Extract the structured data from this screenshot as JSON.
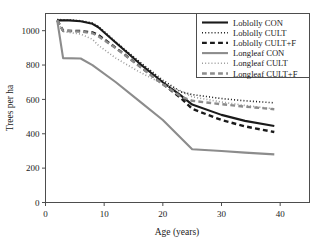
{
  "chart_data": {
    "type": "line",
    "title": "",
    "xlabel": "Age (years)",
    "ylabel": "Trees per ha",
    "xlim": [
      0,
      45
    ],
    "ylim": [
      0,
      1100
    ],
    "xticks": [
      0,
      10,
      20,
      30,
      40
    ],
    "xtick_labels": [
      "0",
      "10",
      "20",
      "30",
      "40"
    ],
    "yticks": [
      0,
      200,
      400,
      600,
      800,
      1000
    ],
    "ytick_labels": [
      "0",
      "200",
      "400",
      "600",
      "800",
      "1000"
    ],
    "grid": false,
    "legend_position": "top-right",
    "series": [
      {
        "name": "Loblolly CON",
        "color": "#1a1a1a",
        "style": "solid",
        "width": 2.1,
        "x": [
          2,
          4,
          6,
          8,
          9,
          12,
          16,
          20,
          23,
          25,
          30,
          34,
          39
        ],
        "y": [
          1060,
          1060,
          1055,
          1040,
          1020,
          930,
          810,
          700,
          625,
          570,
          510,
          475,
          445
        ]
      },
      {
        "name": "Loblolly CULT",
        "color": "#1a1a1a",
        "style": "dotted",
        "width": 1.6,
        "x": [
          2,
          4,
          6,
          8,
          9,
          12,
          16,
          20,
          23,
          25,
          30,
          34,
          39
        ],
        "y": [
          1065,
          1062,
          1058,
          1045,
          1025,
          935,
          820,
          712,
          645,
          628,
          605,
          592,
          580
        ]
      },
      {
        "name": "Loblolly CULT+F",
        "color": "#1a1a1a",
        "style": "dashed",
        "width": 2.4,
        "x": [
          2,
          3,
          6,
          8,
          9,
          12,
          16,
          20,
          23,
          25,
          30,
          34,
          39
        ],
        "y": [
          1060,
          1000,
          998,
          990,
          975,
          900,
          795,
          690,
          610,
          545,
          480,
          443,
          410
        ]
      },
      {
        "name": "Longleaf CON",
        "color": "#8c8c8c",
        "style": "solid",
        "width": 2.1,
        "x": [
          2,
          3,
          6,
          8,
          12,
          16,
          20,
          25,
          30,
          34,
          39
        ],
        "y": [
          1060,
          840,
          838,
          800,
          700,
          590,
          480,
          310,
          300,
          290,
          280
        ]
      },
      {
        "name": "Longleaf CULT",
        "color": "#9a9a9a",
        "style": "dotted",
        "width": 1.6,
        "x": [
          2,
          3,
          6,
          8,
          9,
          12,
          16,
          20,
          23,
          25,
          30,
          34,
          39
        ],
        "y": [
          1058,
          995,
          980,
          950,
          915,
          840,
          760,
          690,
          650,
          615,
          585,
          565,
          545
        ]
      },
      {
        "name": "Longleaf CULT+F",
        "color": "#8c8c8c",
        "style": "dashed",
        "width": 2.4,
        "x": [
          2,
          3,
          6,
          8,
          9,
          12,
          16,
          20,
          23,
          25,
          30,
          34,
          39
        ],
        "y": [
          1060,
          998,
          995,
          985,
          968,
          898,
          793,
          688,
          618,
          592,
          572,
          558,
          543
        ]
      }
    ]
  },
  "axes": {
    "x_title": "Age (years)",
    "y_title": "Trees per ha"
  },
  "legend": {
    "entries": [
      {
        "label": "Loblolly CON"
      },
      {
        "label": "Loblolly CULT"
      },
      {
        "label": "Loblolly CULT+F"
      },
      {
        "label": "Longleaf CON"
      },
      {
        "label": "Longleaf CULT"
      },
      {
        "label": "Longleaf CULT+F"
      }
    ]
  },
  "colors": {
    "loblolly": "#1a1a1a",
    "longleaf": "#8c8c8c",
    "frame": "#4d4d4d",
    "background": "#ffffff"
  }
}
